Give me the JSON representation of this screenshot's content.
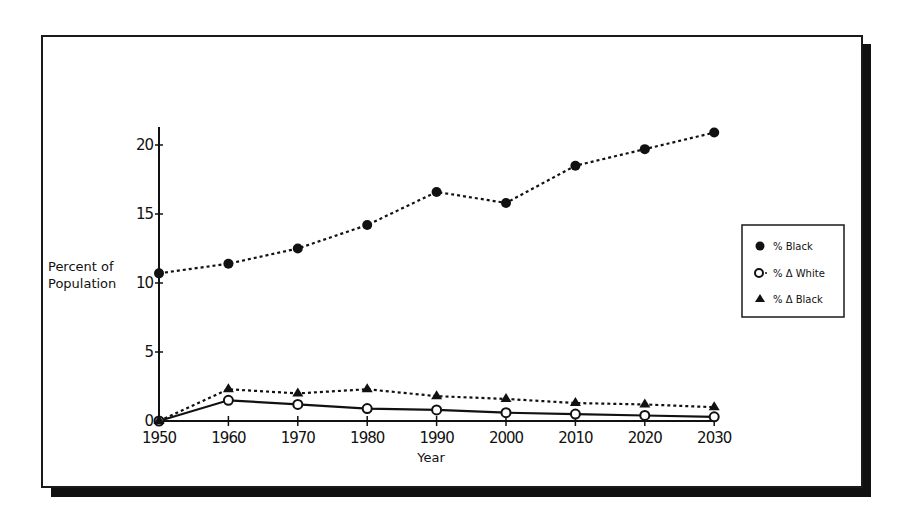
{
  "chart_data": {
    "type": "line",
    "title": "",
    "xlabel": "Year",
    "ylabel": "Percent of Population",
    "ylabel_lines": [
      "Percent of",
      "Population"
    ],
    "x": [
      1950,
      1960,
      1970,
      1980,
      1990,
      2000,
      2010,
      2020,
      2030
    ],
    "x_tick_labels": [
      "1950",
      "1960",
      "1970",
      "1980",
      "1990",
      "2000",
      "2010",
      "2020",
      "2030"
    ],
    "y_ticks": [
      0,
      5,
      10,
      15,
      20
    ],
    "y_tick_labels": [
      "0",
      "5",
      "10",
      "15",
      "20"
    ],
    "ylim": [
      0,
      21
    ],
    "grid": false,
    "legend_position": "right",
    "series": [
      {
        "name": "% Black",
        "marker": "filled-circle",
        "line": "dotted",
        "values": [
          10.7,
          11.4,
          12.5,
          14.2,
          16.6,
          15.8,
          18.5,
          19.7,
          20.9
        ]
      },
      {
        "name": "% Δ White",
        "marker": "open-circle",
        "line": "solid",
        "values": [
          0,
          1.5,
          1.2,
          0.9,
          0.8,
          0.6,
          0.5,
          0.4,
          0.3
        ]
      },
      {
        "name": "% Δ Black",
        "marker": "filled-triangle",
        "line": "dotted",
        "values": [
          0,
          2.3,
          2.0,
          2.3,
          1.8,
          1.6,
          1.3,
          1.2,
          1.0
        ]
      }
    ]
  },
  "legend": {
    "items": [
      {
        "label": "% Black",
        "icon": "filled-circle-icon"
      },
      {
        "label": "% Δ White",
        "icon": "open-circle-icon"
      },
      {
        "label": "% Δ Black",
        "icon": "filled-triangle-icon"
      }
    ]
  },
  "colors": {
    "ink": "#111111",
    "background": "#ffffff",
    "shadow": "#111111"
  }
}
